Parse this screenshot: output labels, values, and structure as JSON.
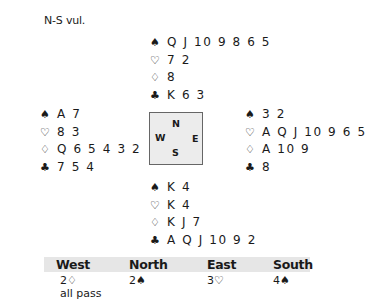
{
  "vulnerability": "N-S vul.",
  "hands": {
    "north": {
      "spades": "Q J 10 9 8 6 5",
      "hearts": "7 2",
      "diamonds": "8",
      "clubs": "K 6 3"
    },
    "west": {
      "spades": "A 7",
      "hearts": "8 3",
      "diamonds": "Q 6 5 4 3 2",
      "clubs": "7 5 4"
    },
    "east": {
      "spades": "3 2",
      "hearts": "A Q J 10 9 6 5",
      "diamonds": "A 10 9",
      "clubs": "8"
    },
    "south": {
      "spades": "K 4",
      "hearts": "K 4",
      "diamonds": "K J 7",
      "clubs": "A Q J 10 9 2"
    }
  },
  "suit_symbols": {
    "spades": "♠",
    "hearts": "♡",
    "diamonds": "♢",
    "clubs": "♣"
  },
  "compass": {
    "n": "N",
    "s": "S",
    "w": "W",
    "e": "E"
  },
  "auction": {
    "headers": [
      "West",
      "North",
      "East",
      "South"
    ],
    "bids": [
      "2♢",
      "2♠",
      "3♡",
      "4♠"
    ],
    "final": "all pass"
  }
}
